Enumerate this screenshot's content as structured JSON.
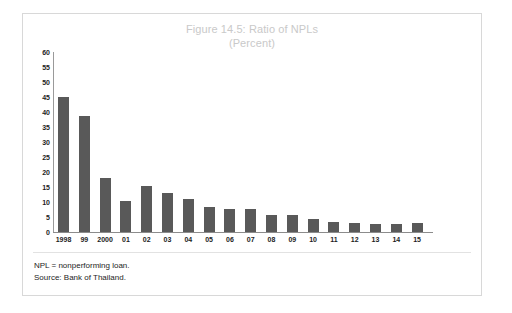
{
  "figure": {
    "title_lines": [
      "Figure 14.5: Ratio of NPLs",
      "(Percent)"
    ],
    "title_color": "#c9c9c9",
    "bar_color": "#595959",
    "frame_color": "#d8d8d8",
    "notes": [
      "NPL = nonperforming loan.",
      "Source: Bank of Thailand."
    ]
  },
  "chart_data": {
    "type": "bar",
    "title": "Figure 14.5: Ratio of NPLs",
    "subtitle": "(Percent)",
    "xlabel": "",
    "ylabel": "",
    "ylim": [
      0,
      60
    ],
    "ytick_step": 5,
    "yticks": [
      0,
      5,
      10,
      15,
      20,
      25,
      30,
      35,
      40,
      45,
      50,
      55,
      60
    ],
    "ytick_labels": [
      "0",
      "5",
      "10",
      "15",
      "20",
      "25",
      "30",
      "35",
      "40",
      "45",
      "50",
      "55",
      "60"
    ],
    "grid": false,
    "legend": false,
    "categories": [
      "1998",
      "99",
      "2000",
      "01",
      "02",
      "03",
      "04",
      "05",
      "06",
      "07",
      "08",
      "09",
      "10",
      "11",
      "12",
      "13",
      "14",
      "15"
    ],
    "values": [
      45,
      38.8,
      17.9,
      10.5,
      15.5,
      13,
      11,
      8.5,
      7.7,
      7.8,
      5.7,
      5.8,
      4.3,
      3.3,
      3,
      2.7,
      2.8,
      3.1
    ],
    "series": [
      {
        "name": "Ratio of NPLs",
        "values": [
          45,
          38.8,
          17.9,
          10.5,
          15.5,
          13,
          11,
          8.5,
          7.7,
          7.8,
          5.7,
          5.8,
          4.3,
          3.3,
          3,
          2.7,
          2.8,
          3.1
        ]
      }
    ]
  }
}
